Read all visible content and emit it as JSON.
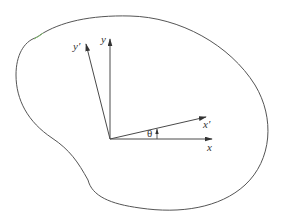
{
  "diagram": {
    "labels": {
      "x": "x",
      "y": "y",
      "x_prime": "x′",
      "y_prime": "y′",
      "angle": "θ"
    },
    "colors": {
      "stroke": "#4a4a4a",
      "body_outline": "#555555",
      "background": "#ffffff"
    },
    "geometry": {
      "origin": [
        110,
        139
      ],
      "x_axis_end": [
        212,
        139
      ],
      "y_axis_end": [
        110,
        38
      ],
      "x_prime_axis_end": [
        206,
        117
      ],
      "y_prime_axis_end": [
        86,
        43
      ]
    }
  }
}
